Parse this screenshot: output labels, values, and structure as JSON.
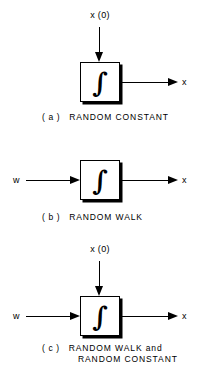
{
  "figure": {
    "background_color": "#ffffff",
    "ink_color": "#000000",
    "block_glyph": "∫",
    "block_glyph_name": "integral-sign"
  },
  "diagrams": [
    {
      "id": "a",
      "tag": "( a )",
      "caption_line1": "RANDOM CONSTANT",
      "caption_line2": "",
      "top_input_label": "x (0)",
      "left_input_label": "",
      "output_label": "x",
      "has_top_input": true,
      "has_left_input": false
    },
    {
      "id": "b",
      "tag": "( b )",
      "caption_line1": "RANDOM WALK",
      "caption_line2": "",
      "top_input_label": "",
      "left_input_label": "w",
      "output_label": "x",
      "has_top_input": false,
      "has_left_input": true
    },
    {
      "id": "c",
      "tag": "( c )",
      "caption_line1": "RANDOM WALK and",
      "caption_line2": "RANDOM CONSTANT",
      "top_input_label": "x (0)",
      "left_input_label": "w",
      "output_label": "x",
      "has_top_input": true,
      "has_left_input": true
    }
  ]
}
